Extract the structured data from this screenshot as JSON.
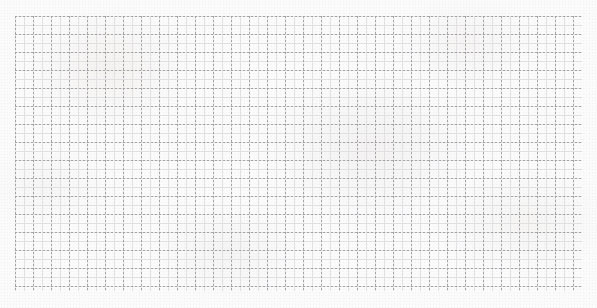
{
  "page": {
    "width": 597,
    "height": 308,
    "background_color": "#fbfbfc",
    "paper_tone": "#f6f4f1"
  },
  "grid": {
    "name": "square-grid",
    "origin_x": 15,
    "origin_y": 16,
    "width": 567,
    "height": 275,
    "cell_size": 18,
    "columns": 31,
    "rows": 15,
    "line_style": "dashed",
    "major_line_color": "#a4a4a6",
    "major_line_width": 1,
    "dash_length": 2,
    "dash_gap": 2,
    "minor_subdivisions": 2,
    "minor_cell_size": 9,
    "minor_line_color": "#e2e2e4",
    "minor_line_width": 1
  },
  "content": {
    "marks": [],
    "labels": [],
    "axis_ticks": [],
    "legend": [],
    "note": ""
  }
}
